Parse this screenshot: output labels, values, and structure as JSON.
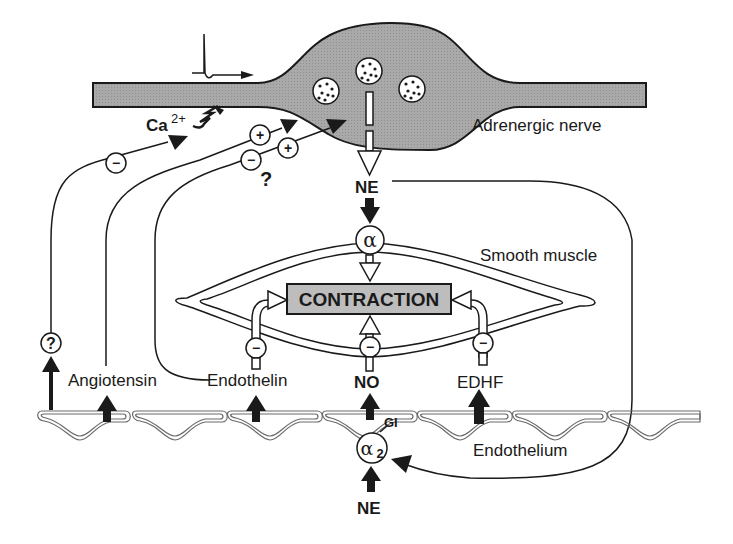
{
  "diagram": {
    "colors": {
      "nerve_fill": "#a8a8a8",
      "contraction_fill": "#bdbdbd",
      "stroke": "#1a1a1a",
      "background": "#ffffff"
    },
    "labels": {
      "nerve": "Adrenergic nerve",
      "ca": "Ca",
      "ca_sup": "2+",
      "ne_top": "NE",
      "alpha": "α",
      "smooth_muscle": "Smooth muscle",
      "contraction": "CONTRACTION",
      "angiotensin": "Angiotensin",
      "endothelin": "Endothelin",
      "no": "NO",
      "edhf": "EDHF",
      "endothelium": "Endothelium",
      "gi": "GI",
      "alpha2": "α",
      "alpha2_sub": "2",
      "ne_bottom": "NE",
      "question_circle": "?",
      "question_free": "?"
    },
    "symbols": {
      "minus": "−",
      "plus": "+"
    },
    "nodes": [
      {
        "id": "adrenergic-nerve",
        "label": "Adrenergic nerve"
      },
      {
        "id": "ne-release",
        "label": "NE"
      },
      {
        "id": "alpha-receptor",
        "label": "α"
      },
      {
        "id": "contraction",
        "label": "CONTRACTION"
      },
      {
        "id": "angiotensin",
        "label": "Angiotensin"
      },
      {
        "id": "endothelin",
        "label": "Endothelin"
      },
      {
        "id": "no",
        "label": "NO"
      },
      {
        "id": "edhf",
        "label": "EDHF"
      },
      {
        "id": "alpha2-receptor",
        "label": "α2"
      },
      {
        "id": "unknown-factor",
        "label": "?"
      }
    ],
    "edges": [
      {
        "from": "adrenergic-nerve",
        "to": "ne-release",
        "sign": "release"
      },
      {
        "from": "ne-release",
        "to": "alpha-receptor",
        "sign": "+"
      },
      {
        "from": "alpha-receptor",
        "to": "contraction",
        "sign": "+"
      },
      {
        "from": "endothelin",
        "to": "contraction",
        "sign": "−"
      },
      {
        "from": "no",
        "to": "contraction",
        "sign": "−"
      },
      {
        "from": "edhf",
        "to": "contraction",
        "sign": "−"
      },
      {
        "from": "unknown-factor",
        "to": "adrenergic-nerve",
        "sign": "−"
      },
      {
        "from": "angiotensin",
        "to": "adrenergic-nerve",
        "sign": "+"
      },
      {
        "from": "endothelin",
        "to": "adrenergic-nerve",
        "sign": "− / + ?"
      },
      {
        "from": "ne-release",
        "to": "alpha2-receptor",
        "sign": "+"
      },
      {
        "from": "alpha2-receptor",
        "to": "no",
        "sign": "+ (GI)"
      }
    ]
  }
}
